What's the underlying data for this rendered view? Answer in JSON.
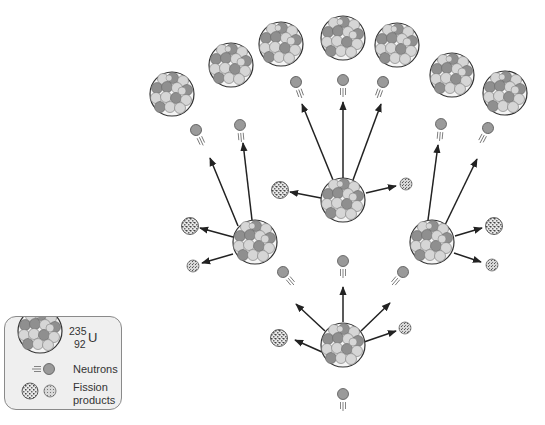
{
  "legend": {
    "uranium": {
      "mass_number": "235",
      "symbol": "U",
      "atomic_number": "92"
    },
    "neutrons_label": "Neutrons",
    "fission_products_label_line1": "Fission",
    "fission_products_label_line2": "products"
  },
  "colors": {
    "nucleon_dark": "#8f8f8f",
    "nucleon_light": "#d6d6d6",
    "nucleus_outline": "#333333",
    "neutron_fill": "#9a9a9a",
    "arrow": "#222222",
    "legend_bg": "#efefef",
    "legend_border": "#8a8a8a"
  },
  "diagram": {
    "generations": [
      {
        "name": "initial",
        "neutrons": 1,
        "nuclei": 1
      },
      {
        "name": "generation-1",
        "neutrons": 3,
        "nuclei": 3
      },
      {
        "name": "generation-2",
        "neutrons": 7,
        "nuclei": 7
      }
    ]
  }
}
